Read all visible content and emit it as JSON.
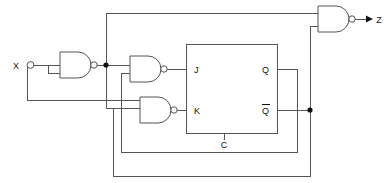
{
  "diagram": {
    "type": "logic-circuit-schematic",
    "width": 386,
    "height": 183,
    "colors": {
      "wire": "#555555",
      "background": "#ffffff",
      "text": "#111111",
      "junction": "#111111"
    }
  },
  "ports": {
    "input": {
      "label": "X",
      "name": "input-x"
    },
    "output": {
      "label": "Z",
      "name": "output-z"
    }
  },
  "flipflop": {
    "kind": "JK",
    "inputs": {
      "j": "J",
      "k": "K",
      "clock": "C"
    },
    "outputs": {
      "q": "Q",
      "qbar": "Q",
      "qbar_overbar": true
    }
  },
  "gates": [
    {
      "name": "nand-gate-inverter",
      "type": "NAND",
      "role": "inverter",
      "inputs": 2,
      "label": ""
    },
    {
      "name": "nand-gate-j",
      "type": "NAND",
      "role": "drives-J",
      "inputs": 2,
      "label": ""
    },
    {
      "name": "nand-gate-k",
      "type": "NAND",
      "role": "drives-K",
      "inputs": 2,
      "label": ""
    },
    {
      "name": "nand-gate-output",
      "type": "NAND",
      "role": "drives-Z",
      "inputs": 2,
      "label": ""
    }
  ],
  "nets": [
    {
      "name": "net-x-input",
      "from": "X",
      "to": "nand-gate-inverter"
    },
    {
      "name": "net-x-feedback-down",
      "from": "X",
      "to": "nand-gate-k"
    },
    {
      "name": "net-inverter-out",
      "from": "nand-gate-inverter",
      "to": "nand-gate-j"
    },
    {
      "name": "net-inverter-top-feedback",
      "from": "nand-gate-inverter",
      "to": "nand-gate-output"
    },
    {
      "name": "net-j-drive",
      "from": "nand-gate-j",
      "to": "J"
    },
    {
      "name": "net-k-drive",
      "from": "nand-gate-k",
      "to": "K"
    },
    {
      "name": "net-q-feedback",
      "from": "Q",
      "to": "nand-gate-k"
    },
    {
      "name": "net-qbar-feedback",
      "from": "Qbar",
      "to": "nand-gate-j"
    },
    {
      "name": "net-qbar-to-output-gate",
      "from": "Qbar",
      "to": "nand-gate-output"
    },
    {
      "name": "net-clock",
      "from": "C",
      "to": "clock-bus"
    }
  ]
}
